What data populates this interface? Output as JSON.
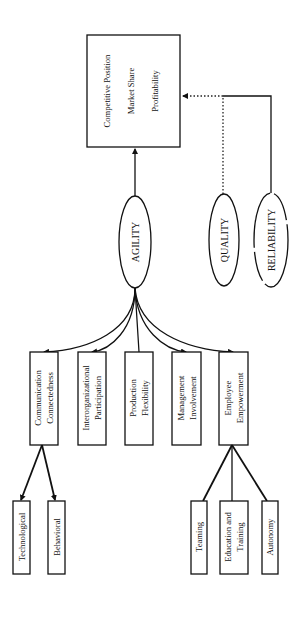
{
  "diagram": {
    "outcome": {
      "lines": [
        "Competitive Position",
        "Market Share",
        "Profitability"
      ]
    },
    "drivers": {
      "agility": "AGILITY",
      "quality": "QUALITY",
      "reliability": "RELIABILITY"
    },
    "agility_factors": [
      {
        "line1": "Communication",
        "line2": "Connectedness"
      },
      {
        "line1": "Interorganizational",
        "line2": "Participation"
      },
      {
        "line1": "Production",
        "line2": "Flexibility"
      },
      {
        "line1": "Management",
        "line2": "Involvement"
      },
      {
        "line1": "Employee",
        "line2": "Empowerment"
      }
    ],
    "communication_subfactors": [
      "Technological",
      "Behavioral"
    ],
    "empowerment_subfactors": [
      {
        "line1": "Teaming",
        "line2": ""
      },
      {
        "line1": "Education and",
        "line2": "Training"
      },
      {
        "line1": "Autonomy",
        "line2": ""
      }
    ],
    "colors": {
      "stroke": "#111111",
      "background": "#ffffff"
    },
    "orientation": "rotated 90 degrees; text reads bottom-to-top"
  }
}
